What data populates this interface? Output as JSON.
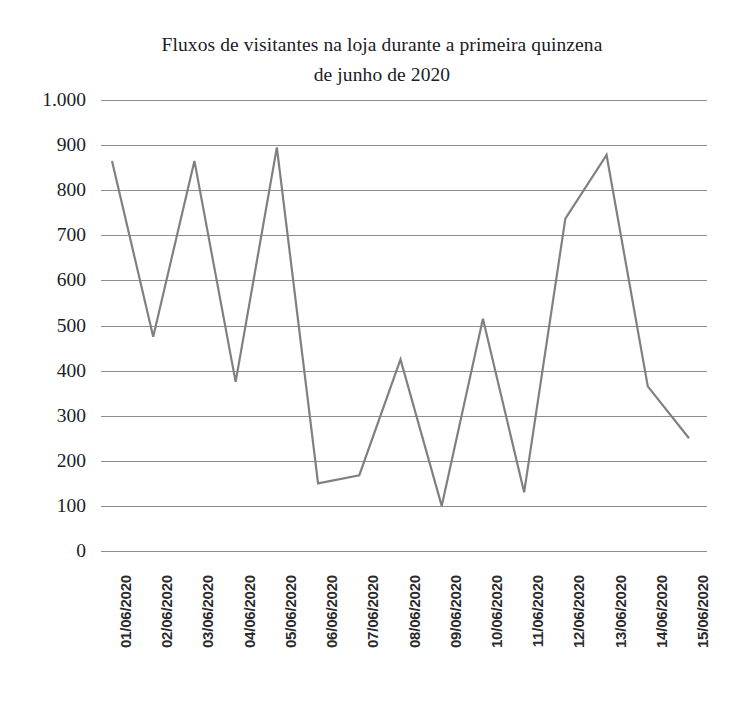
{
  "chart_data": {
    "type": "line",
    "title": "Fluxos de visitantes na loja durante a primeira quinzena de junho de 2020",
    "title_lines": [
      "Fluxos de visitantes na loja durante a primeira quinzena",
      "de junho de 2020"
    ],
    "xlabel": "",
    "ylabel": "",
    "categories": [
      "01/06/2020",
      "02/06/2020",
      "03/06/2020",
      "04/06/2020",
      "05/06/2020",
      "06/06/2020",
      "07/06/2020",
      "08/06/2020",
      "09/06/2020",
      "10/06/2020",
      "11/06/2020",
      "12/06/2020",
      "13/06/2020",
      "14/06/2020",
      "15/06/2020"
    ],
    "values": [
      865,
      475,
      865,
      375,
      895,
      150,
      168,
      425,
      100,
      515,
      130,
      737,
      878,
      365,
      250
    ],
    "series": [
      {
        "name": "Fluxo de visitantes",
        "color": "#808080",
        "values": [
          865,
          475,
          865,
          375,
          895,
          150,
          168,
          425,
          100,
          515,
          130,
          737,
          878,
          365,
          250
        ]
      }
    ],
    "ylim": [
      0,
      1000
    ],
    "ytick_labels": [
      "1.000",
      "900",
      "800",
      "700",
      "600",
      "500",
      "400",
      "300",
      "200",
      "100",
      "0"
    ],
    "ytick_values": [
      1000,
      900,
      800,
      700,
      600,
      500,
      400,
      300,
      200,
      100,
      0
    ],
    "grid": true,
    "grid_color": "#8d8d8d",
    "legend": false,
    "legend_position": "none",
    "markers": false,
    "line_width": 2,
    "background": "#ffffff",
    "x_tick_rotation": -90
  }
}
